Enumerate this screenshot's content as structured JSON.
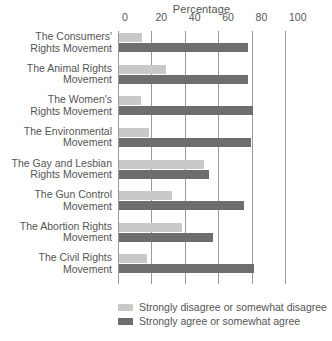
{
  "chart_data": {
    "type": "bar",
    "orientation": "horizontal",
    "title": "Percentage",
    "xlabel": "Percentage",
    "ylabel": "",
    "xlim": [
      0,
      100
    ],
    "xticks": [
      0,
      20,
      40,
      60,
      80,
      100
    ],
    "xtick_labels": [
      "0",
      "20",
      "40",
      "60",
      "80",
      "100"
    ],
    "grid": true,
    "legend_position": "bottom-left",
    "categories": [
      "The Consumers' Rights Movement",
      "The Animal Rights Movement",
      "The Women's Rights Movement",
      "The Environmental Movement",
      "The Gay and Lesbian Rights Movement",
      "The Gun Control Movement",
      "The Abortion Rights Movement",
      "The Civil Rights Movement"
    ],
    "category_lines": [
      [
        "The Consumers'",
        "Rights Movement"
      ],
      [
        "The Animal Rights",
        "Movement"
      ],
      [
        "The Women's",
        "Rights Movement"
      ],
      [
        "The Environmental",
        "Movement"
      ],
      [
        "The Gay and Lesbian",
        "Rights Movement"
      ],
      [
        "The Gun Control",
        "Movement"
      ],
      [
        "The Abortion Rights",
        "Movement"
      ],
      [
        "The Civil Rights",
        "Movement"
      ]
    ],
    "series": [
      {
        "name": "Strongly disagree or somewhat disagree",
        "color": "#c9c9c9",
        "values": [
          14,
          28,
          13,
          18,
          51,
          32,
          38,
          17
        ]
      },
      {
        "name": "Strongly agree or somewhat agree",
        "color": "#6e6e6e",
        "values": [
          77,
          77,
          80,
          79,
          54,
          75,
          56,
          81
        ]
      }
    ]
  },
  "legend": {
    "items": [
      {
        "label": "Strongly disagree or somewhat disagree",
        "color": "#c9c9c9"
      },
      {
        "label": "Strongly agree or somewhat agree",
        "color": "#6e6e6e"
      }
    ]
  },
  "colors": {
    "disagree": "#c9c9c9",
    "agree": "#6e6e6e",
    "gridline": "#9a9a9a",
    "text": "#555555",
    "background": "#ffffff"
  }
}
